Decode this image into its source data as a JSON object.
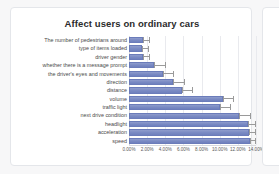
{
  "chart_data": {
    "type": "bar",
    "orientation": "horizontal",
    "title": "Affect users on ordinary cars",
    "xlabel": "",
    "ylabel": "",
    "xlim": [
      0,
      14
    ],
    "grid": true,
    "legend": false,
    "value_suffix": "%",
    "xticks": [
      "0.00%",
      "2.00%",
      "4.00%",
      "6.00%",
      "8.00%",
      "10.00%",
      "12.00%",
      "14.00%"
    ],
    "xtick_values": [
      0,
      2,
      4,
      6,
      8,
      10,
      12,
      14
    ],
    "categories": [
      "The number of pedestrians around",
      "type of items loaded",
      "driver gender",
      "whether there is a message prompt",
      "the driver's eyes and movements",
      "direction",
      "distance",
      "volume",
      "traffic light",
      "next drive condition",
      "headlight",
      "acceleration",
      "speed"
    ],
    "values": [
      1.5,
      1.4,
      1.5,
      2.8,
      3.7,
      4.9,
      5.8,
      10.4,
      10.0,
      12.1,
      13.1,
      13.2,
      13.3
    ],
    "error_low": [
      1.5,
      1.4,
      1.5,
      2.8,
      3.7,
      4.9,
      5.8,
      10.4,
      10.0,
      12.1,
      13.1,
      13.2,
      13.3
    ],
    "error_high": [
      2.3,
      2.2,
      2.3,
      4.1,
      5.0,
      6.2,
      7.1,
      11.6,
      11.3,
      13.4,
      14.0,
      14.0,
      14.0
    ],
    "bar_color": "#7b8bc4",
    "error_color": "#9a9a9a",
    "grid_color": "#e9eaee"
  }
}
